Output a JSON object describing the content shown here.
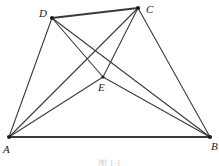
{
  "figure": {
    "caption": "图 1-1",
    "stroke_color": "#3b3b3b",
    "vertex_dot_color": "#1c1c1c",
    "background_color": "#ffffff",
    "label_color": "#1c1c1c"
  },
  "labels": {
    "a": "A",
    "b": "B",
    "c": "C",
    "d": "D",
    "e": "E"
  },
  "chart_data": {
    "type": "diagram",
    "title": "图 1-1",
    "points": [
      {
        "name": "A",
        "x": 9,
        "y": 137,
        "label_x": 3,
        "label_y": 144,
        "dot": true
      },
      {
        "name": "B",
        "x": 210,
        "y": 137,
        "label_x": 211,
        "label_y": 141,
        "dot": true
      },
      {
        "name": "C",
        "x": 138,
        "y": 8,
        "label_x": 146,
        "label_y": 4,
        "dot": true
      },
      {
        "name": "D",
        "x": 52,
        "y": 18,
        "label_x": 39,
        "label_y": 8,
        "dot": true
      },
      {
        "name": "E",
        "x": 103,
        "y": 77,
        "label_x": 98,
        "label_y": 82,
        "dot": true
      }
    ],
    "segments": [
      {
        "name": "AB",
        "from": "A",
        "to": "B",
        "width": 2.2,
        "role": "quadrilateral-side"
      },
      {
        "name": "DC",
        "from": "D",
        "to": "C",
        "width": 2.2,
        "role": "quadrilateral-side"
      },
      {
        "name": "AD",
        "from": "A",
        "to": "D",
        "width": 1.1,
        "role": "quadrilateral-side"
      },
      {
        "name": "CB",
        "from": "C",
        "to": "B",
        "width": 1.1,
        "role": "quadrilateral-side"
      },
      {
        "name": "AC",
        "from": "A",
        "to": "C",
        "width": 1.1,
        "role": "diagonal"
      },
      {
        "name": "DB",
        "from": "D",
        "to": "B",
        "width": 1.1,
        "role": "diagonal"
      },
      {
        "name": "AE",
        "from": "A",
        "to": "E",
        "width": 1.1,
        "role": "cevian"
      },
      {
        "name": "EC",
        "from": "E",
        "to": "C",
        "width": 1.1,
        "role": "cevian"
      },
      {
        "name": "EB",
        "from": "E",
        "to": "B",
        "width": 1.1,
        "role": "cevian"
      },
      {
        "name": "DE",
        "from": "D",
        "to": "E",
        "width": 1.1,
        "role": "cevian"
      }
    ],
    "xlim": [
      0,
      219
    ],
    "ylim": [
      0,
      166
    ],
    "grid": false,
    "legend": null
  }
}
